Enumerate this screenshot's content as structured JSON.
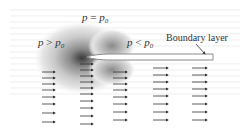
{
  "labels": {
    "ambient": {
      "p": "p",
      "op": " = ",
      "p0": "p",
      "sub": "0"
    },
    "stagnation": {
      "p": "p",
      "op": " > ",
      "p0": "p",
      "sub": "0"
    },
    "suction": {
      "p": "p",
      "op": " < ",
      "p0": "p",
      "sub": "0"
    },
    "boundary_layer": "Boundary layer"
  },
  "colors": {
    "background": "#ffffff",
    "plate_edge": "#8a8a8a",
    "arrow": "#333333",
    "streamline": "#d9d9d9",
    "contour_dark": "#555555",
    "contour_light": "#eeeeee"
  },
  "plate": {
    "leading_edge_x": 88,
    "trailing_x": 213,
    "top_y": 54,
    "bottom_y": 60
  },
  "arrow_columns": [
    {
      "x": 42,
      "length": 13,
      "rows": [
        72,
        78,
        84,
        90,
        97,
        104,
        113,
        122
      ]
    },
    {
      "x": 80,
      "length": 13,
      "rows": [
        64,
        70,
        76,
        82,
        88,
        94,
        101,
        108,
        116,
        124
      ]
    },
    {
      "x": 113,
      "length": 14,
      "rows": [
        72,
        78,
        84,
        90,
        97,
        104,
        112,
        120
      ]
    },
    {
      "x": 153,
      "length": 15,
      "rows": [
        68,
        75,
        82,
        89,
        96,
        104,
        112,
        120
      ]
    },
    {
      "x": 192,
      "length": 15,
      "rows": [
        68,
        75,
        82,
        89,
        96,
        104,
        112,
        120
      ]
    }
  ]
}
